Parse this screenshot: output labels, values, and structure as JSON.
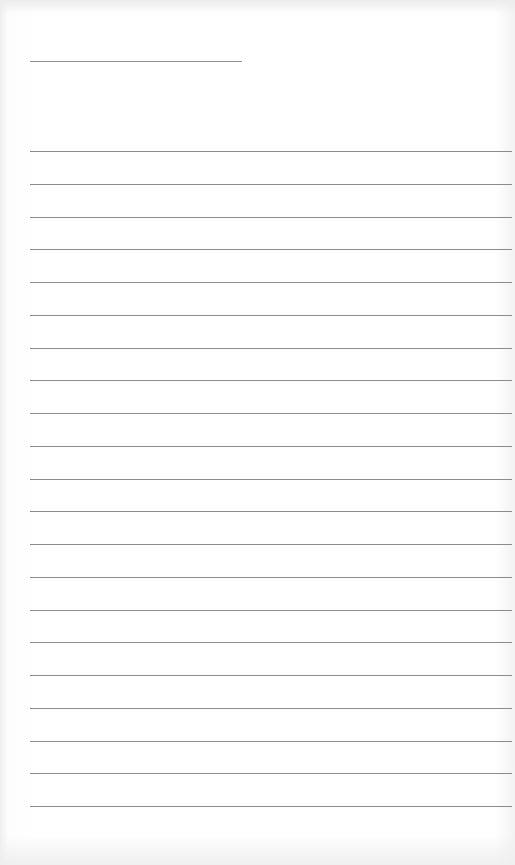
{
  "document": {
    "type": "lined writing sheet",
    "header_field": {
      "label": "",
      "value": ""
    },
    "lines": {
      "count": 21,
      "first_y": 151,
      "spacing": 32.75,
      "left": 30,
      "width": 482,
      "color": "#8c8c8c",
      "values": [
        "",
        "",
        "",
        "",
        "",
        "",
        "",
        "",
        "",
        "",
        "",
        "",
        "",
        "",
        "",
        "",
        "",
        "",
        "",
        "",
        ""
      ]
    },
    "header_line_color": "#8f8f8f",
    "paper_color": "#ffffff"
  }
}
